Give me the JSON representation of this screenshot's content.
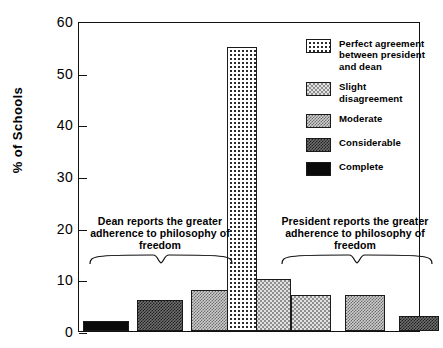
{
  "chart_data": {
    "type": "bar",
    "title": "",
    "xlabel": "",
    "ylabel": "% of Schools",
    "ylim": [
      0,
      60
    ],
    "ytick_labels": [
      "0",
      "10",
      "20",
      "30",
      "40",
      "50",
      "60"
    ],
    "ytick_values": [
      0,
      10,
      20,
      30,
      40,
      50,
      60
    ],
    "grid": false,
    "legend_position": "right",
    "categories": [
      "Complete (dean)",
      "Considerable (dean)",
      "Moderate (dean)",
      "Slight disagreement (dean)",
      "Perfect agreement",
      "Slight disagreement (president)",
      "Moderate (president)",
      "Considerable (president)",
      "Complete (president)"
    ],
    "values": [
      2,
      6,
      8,
      10,
      55,
      7,
      7,
      3,
      0.5
    ],
    "bar_patterns": [
      "complete",
      "considerable",
      "moderate",
      "slight",
      "perfect",
      "slight",
      "moderate",
      "considerable",
      "complete"
    ],
    "annotations": [
      "Dean reports the greater\nadherence to philosophy\nof freedom",
      "President reports the greater\nadherence to philosophy\nof freedom"
    ],
    "legend": [
      {
        "label": "Perfect agreement\nbetween president\nand dean",
        "pattern": "perfect"
      },
      {
        "label": "Slight disagreement",
        "pattern": "slight"
      },
      {
        "label": "Moderate",
        "pattern": "moderate"
      },
      {
        "label": "Considerable",
        "pattern": "considerable"
      },
      {
        "label": "Complete",
        "pattern": "complete"
      }
    ]
  },
  "axis": {
    "y_label": "% of Schools",
    "ticks": [
      "60",
      "50",
      "40",
      "30",
      "20",
      "10",
      "0"
    ]
  },
  "annotations": {
    "left": "Dean reports the greater\nadherence to philosophy\nof freedom",
    "right": "President reports the greater\nadherence to philosophy\nof freedom"
  },
  "legend": {
    "items": [
      {
        "label": "Perfect agreement\nbetween president\nand dean"
      },
      {
        "label": "Slight disagreement"
      },
      {
        "label": "Moderate"
      },
      {
        "label": "Considerable"
      },
      {
        "label": "Complete"
      }
    ]
  },
  "colors": {
    "ink": "#111111",
    "background": "#ffffff"
  }
}
